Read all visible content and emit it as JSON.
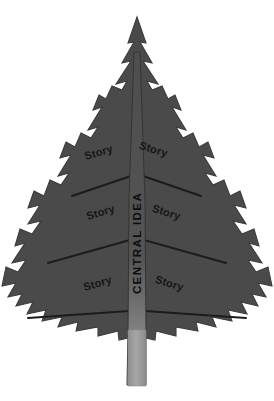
{
  "diagram": {
    "type": "graphic-organizer",
    "shape": "fir-tree",
    "title_text": "CENTRAL IDEA",
    "background_color": "#ffffff",
    "tree_color": "#4a4a4a",
    "tree_outline_color": "#3a3a3a",
    "divider_color": "#1d1d1d",
    "trunk_top_color": "#4e4e4e",
    "trunk_bottom_color": "#9a9a9a",
    "text_color": "#16161a",
    "central": {
      "label": "CENTRAL IDEA",
      "orientation": "vertical-bottom-to-top",
      "style": "bold-uppercase"
    },
    "branches": [
      {
        "row": 1,
        "side": "left",
        "label": "Story"
      },
      {
        "row": 1,
        "side": "right",
        "label": "Story"
      },
      {
        "row": 2,
        "side": "left",
        "label": "Story"
      },
      {
        "row": 2,
        "side": "right",
        "label": "Story"
      },
      {
        "row": 3,
        "side": "left",
        "label": "Story"
      },
      {
        "row": 3,
        "side": "right",
        "label": "Story"
      }
    ],
    "counts": {
      "story_sections": 6,
      "rows": 3,
      "columns": 2
    }
  }
}
